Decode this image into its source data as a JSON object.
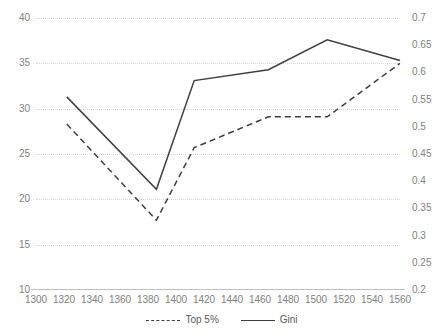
{
  "chart_data": {
    "type": "line",
    "title": "",
    "xlabel": "",
    "ylabel": "",
    "grid": true,
    "legend_position": "bottom",
    "x_axis": {
      "min": 1300,
      "max": 1560,
      "step": 20,
      "ticks": [
        1300,
        1320,
        1340,
        1360,
        1380,
        1400,
        1420,
        1440,
        1460,
        1480,
        1500,
        1520,
        1540,
        1560
      ]
    },
    "y_axis_left": {
      "min": 10,
      "max": 40,
      "step": 5,
      "ticks": [
        40,
        35,
        30,
        25,
        20,
        15,
        10
      ],
      "tick_labels": [
        "40",
        "35",
        "30",
        "25",
        "20",
        "15",
        "10"
      ]
    },
    "y_axis_right": {
      "min": 0.2,
      "max": 0.7,
      "step": 0.05,
      "ticks": [
        0.7,
        0.65,
        0.6,
        0.55,
        0.5,
        0.45,
        0.4,
        0.35,
        0.3,
        0.25,
        0.2
      ],
      "tick_labels": [
        "0.7",
        "0.65",
        "0.6",
        "0.55",
        "0.5",
        "0.45",
        "0.4",
        "0.35",
        "0.3",
        "0.25",
        "0.2"
      ]
    },
    "series": [
      {
        "name": "Top 5%",
        "axis": "left",
        "style": "dashed",
        "color": "#3f3f3f",
        "x": [
          1322,
          1386,
          1413,
          1466,
          1508,
          1560
        ],
        "values": [
          28.3,
          17.7,
          25.7,
          29.1,
          29.1,
          35.0
        ]
      },
      {
        "name": "Gini",
        "axis": "right",
        "style": "solid",
        "color": "#3f3f3f",
        "x": [
          1322,
          1386,
          1413,
          1466,
          1508,
          1560
        ],
        "values": [
          0.555,
          0.385,
          0.585,
          0.605,
          0.66,
          0.622
        ]
      }
    ],
    "colors": {
      "gridline": "#d9d9d9",
      "axis": "#bfbfbf",
      "tick_text": "#7f7f7f",
      "legend_text": "#595959",
      "line": "#3f3f3f",
      "background": "#ffffff"
    }
  },
  "legend": {
    "items": [
      {
        "label": "Top 5%"
      },
      {
        "label": "Gini"
      }
    ]
  }
}
